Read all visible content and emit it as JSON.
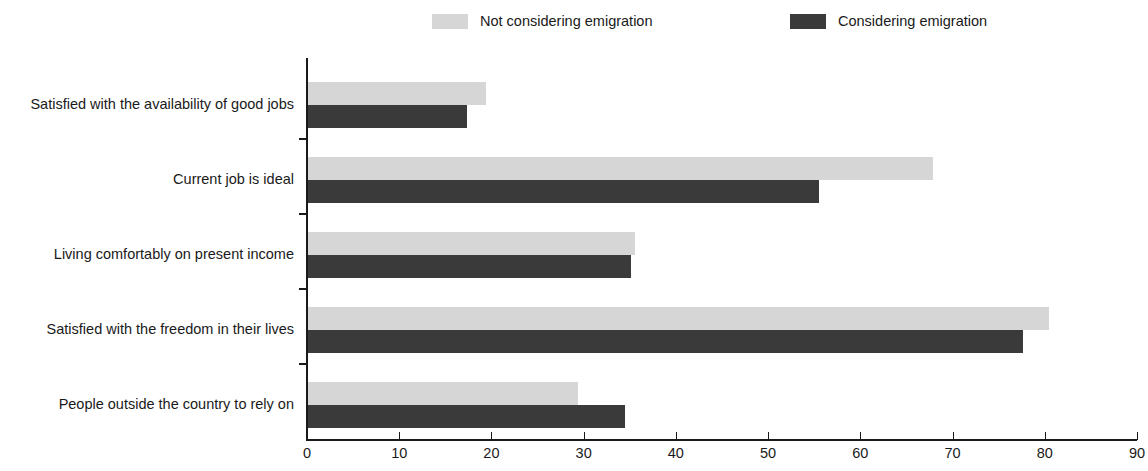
{
  "legend": {
    "items": [
      {
        "label": "Not considering emigration",
        "color": "#d6d6d6",
        "key": "not_considering"
      },
      {
        "label": "Considering emigration",
        "color": "#3a3a3a",
        "key": "considering"
      }
    ]
  },
  "axis": {
    "x_ticks": [
      "0",
      "10",
      "20",
      "30",
      "40",
      "50",
      "60",
      "70",
      "80",
      "90"
    ]
  },
  "chart_data": {
    "type": "bar",
    "orientation": "horizontal",
    "title": "",
    "subtitle": "",
    "xlabel": "",
    "ylabel": "",
    "xlim": [
      0,
      90
    ],
    "xticks": [
      0,
      10,
      20,
      30,
      40,
      50,
      60,
      70,
      80,
      90
    ],
    "grid": false,
    "legend_position": "top",
    "categories": [
      "Satisfied with the availability of good jobs",
      "Current job is ideal",
      "Living comfortably on present income",
      "Satisfied with the freedom in their lives",
      "People outside the country to rely on"
    ],
    "series": [
      {
        "name": "Not considering emigration",
        "color": "#d6d6d6",
        "values": [
          19.3,
          67.8,
          35.5,
          80.3,
          29.3
        ]
      },
      {
        "name": "Considering emigration",
        "color": "#3a3a3a",
        "values": [
          17.2,
          55.4,
          35.0,
          77.5,
          34.4
        ]
      }
    ]
  }
}
